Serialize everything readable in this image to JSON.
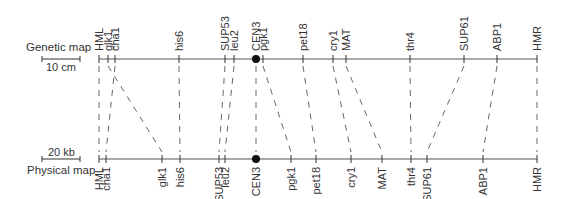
{
  "genetic_map": {
    "title": "Genetic map",
    "scale_label": "10 cm",
    "line_y": 59,
    "x_start": 99,
    "x_end": 537,
    "loci": [
      {
        "name": "HML",
        "x": 99
      },
      {
        "name": "glk1",
        "x": 108
      },
      {
        "name": "cha1",
        "x": 115
      },
      {
        "name": "his6",
        "x": 179
      },
      {
        "name": "SUP53",
        "x": 225
      },
      {
        "name": "leu2",
        "x": 234
      },
      {
        "name": "CEN3",
        "x": 256,
        "centromere": true
      },
      {
        "name": "pgk1",
        "x": 263
      },
      {
        "name": "pet18",
        "x": 303
      },
      {
        "name": "cry1",
        "x": 333
      },
      {
        "name": "MAT",
        "x": 346
      },
      {
        "name": "thr4",
        "x": 410
      },
      {
        "name": "SUP61",
        "x": 464
      },
      {
        "name": "ABP1",
        "x": 497
      },
      {
        "name": "HMR",
        "x": 537
      }
    ]
  },
  "physical_map": {
    "title": "Physical map",
    "scale_label": "20 kb",
    "line_y": 159,
    "x_start": 99,
    "x_end": 537,
    "loci": [
      {
        "name": "HML",
        "x": 99
      },
      {
        "name": "cha1",
        "x": 106
      },
      {
        "name": "glk1",
        "x": 162
      },
      {
        "name": "his6",
        "x": 180
      },
      {
        "name": "SUP53",
        "x": 219
      },
      {
        "name": "leu2",
        "x": 225
      },
      {
        "name": "CEN3",
        "x": 256,
        "centromere": true
      },
      {
        "name": "pgk1",
        "x": 291
      },
      {
        "name": "pet18",
        "x": 316
      },
      {
        "name": "cry1",
        "x": 351
      },
      {
        "name": "MAT",
        "x": 382
      },
      {
        "name": "thr4",
        "x": 411
      },
      {
        "name": "SUP61",
        "x": 427
      },
      {
        "name": "ABP1",
        "x": 483
      },
      {
        "name": "HMR",
        "x": 537
      }
    ]
  },
  "colors": {
    "line": "#555555",
    "text": "#333333"
  }
}
